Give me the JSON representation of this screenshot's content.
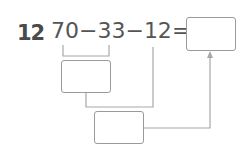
{
  "problem": {
    "number": "12",
    "expression": {
      "t1": "70",
      "op1": "−",
      "t2": "33",
      "op2": "−",
      "t3": "12",
      "eq": "="
    }
  },
  "answer_boxes": [
    {
      "id": "intermediate-1",
      "value": ""
    },
    {
      "id": "intermediate-2",
      "value": ""
    },
    {
      "id": "final",
      "value": ""
    }
  ],
  "colors": {
    "text": "#555555",
    "line": "#a0a0a0"
  }
}
